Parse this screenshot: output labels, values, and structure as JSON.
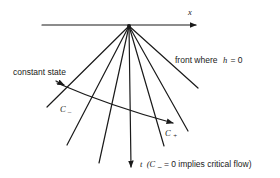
{
  "figure": {
    "axes": {
      "x_label": "x",
      "t_label": "t",
      "t_note": "(C",
      "t_note_sub": "–",
      "t_note_rest": "= 0 implies critical flow)"
    },
    "labels": {
      "front": "front where",
      "front_var": "h",
      "front_eq": "= 0",
      "constant_state": "constant state",
      "c_minus": "C",
      "c_minus_sub": "–",
      "c_plus": "C",
      "c_plus_sub": "+"
    },
    "apex": [
      129,
      26
    ],
    "fan_line_endpoints": [
      [
        47,
        107
      ],
      [
        67,
        145
      ],
      [
        99,
        163
      ],
      [
        164,
        146
      ],
      [
        188,
        131
      ],
      [
        198,
        88
      ]
    ],
    "colors": {
      "ink": "#1a1a1a",
      "background": "#ffffff"
    }
  }
}
